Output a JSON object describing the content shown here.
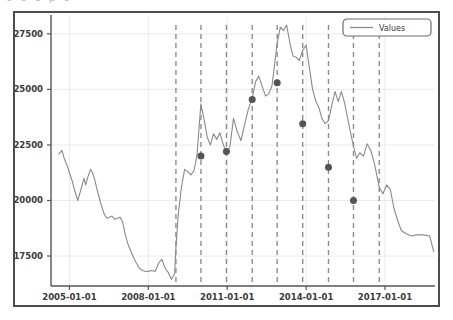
{
  "figure": {
    "background_color": "#ffffff",
    "frame_color": "#4d4d4d",
    "scan_artifact_text": "o    o  o  p  o"
  },
  "chart_data": {
    "type": "line",
    "title": "",
    "subtitle": "",
    "xlabel": "",
    "ylabel": "",
    "grid": true,
    "grid_color": "#e8e8ec",
    "legend": {
      "position": "upper right",
      "entries": [
        {
          "label": "Values",
          "color": "#8a8a8a",
          "marker": "line"
        }
      ]
    },
    "line_color": "#8a8a8a",
    "line_width": 1.1,
    "marker_color": "#545454",
    "marker_size": 7,
    "xaxis": {
      "type": "date",
      "tick_labels": [
        "2005-01-01",
        "2008-01-01",
        "2011-01-01",
        "2014-01-01",
        "2017-01-01"
      ],
      "tick_values": [
        2005.0,
        2008.0,
        2011.0,
        2014.0,
        2017.0
      ],
      "xlim": [
        2004.3,
        2018.9
      ]
    },
    "yaxis": {
      "tick_labels": [
        "17500",
        "20000",
        "22500",
        "25000",
        "27500"
      ],
      "tick_values": [
        17500,
        20000,
        22500,
        25000,
        27500
      ],
      "ylim": [
        16150,
        28350
      ]
    },
    "vlines": {
      "color": "#8a8a8a",
      "style": "dashed",
      "x_values": [
        2009.05,
        2010.0,
        2010.97,
        2011.95,
        2012.9,
        2013.87,
        2014.85,
        2015.8,
        2016.78
      ]
    },
    "markers": [
      {
        "x": 2010.0,
        "y": 22000
      },
      {
        "x": 2010.97,
        "y": 22200
      },
      {
        "x": 2011.95,
        "y": 24550
      },
      {
        "x": 2012.9,
        "y": 25300
      },
      {
        "x": 2013.87,
        "y": 23450
      },
      {
        "x": 2014.85,
        "y": 21500
      },
      {
        "x": 2015.8,
        "y": 20000
      }
    ],
    "series": [
      {
        "name": "Values",
        "x": [
          2004.6,
          2004.72,
          2004.8,
          2004.92,
          2005.0,
          2005.1,
          2005.2,
          2005.32,
          2005.44,
          2005.55,
          2005.62,
          2005.7,
          2005.8,
          2005.88,
          2005.96,
          2006.05,
          2006.14,
          2006.22,
          2006.32,
          2006.42,
          2006.52,
          2006.62,
          2006.72,
          2006.82,
          2006.92,
          2007.02,
          2007.12,
          2007.22,
          2007.34,
          2007.45,
          2007.56,
          2007.66,
          2007.78,
          2007.9,
          2008.02,
          2008.14,
          2008.26,
          2008.4,
          2008.52,
          2008.64,
          2008.76,
          2008.88,
          2009.0,
          2009.05,
          2009.14,
          2009.26,
          2009.38,
          2009.5,
          2009.62,
          2009.74,
          2009.85,
          2010.0,
          2010.12,
          2010.24,
          2010.36,
          2010.48,
          2010.6,
          2010.72,
          2010.84,
          2010.97,
          2011.1,
          2011.24,
          2011.38,
          2011.52,
          2011.66,
          2011.8,
          2011.95,
          2012.08,
          2012.2,
          2012.34,
          2012.46,
          2012.58,
          2012.7,
          2012.8,
          2012.9,
          2013.02,
          2013.14,
          2013.26,
          2013.38,
          2013.5,
          2013.62,
          2013.74,
          2013.87,
          2014.0,
          2014.12,
          2014.24,
          2014.36,
          2014.48,
          2014.6,
          2014.72,
          2014.85,
          2014.98,
          2015.1,
          2015.22,
          2015.34,
          2015.46,
          2015.58,
          2015.7,
          2015.8,
          2015.92,
          2016.04,
          2016.18,
          2016.32,
          2016.46,
          2016.6,
          2016.78,
          2016.92,
          2017.06,
          2017.2,
          2017.34,
          2017.48,
          2017.62,
          2017.8,
          2018.0,
          2018.2,
          2018.45,
          2018.7,
          2018.85
        ],
        "y": [
          22100,
          22250,
          21900,
          21550,
          21250,
          20900,
          20450,
          20000,
          20500,
          21000,
          20700,
          21050,
          21400,
          21250,
          20950,
          20500,
          20100,
          19750,
          19400,
          19200,
          19250,
          19300,
          19150,
          19200,
          19250,
          19050,
          18500,
          18050,
          17700,
          17400,
          17150,
          16950,
          16850,
          16800,
          16820,
          16850,
          16800,
          17200,
          17350,
          16950,
          16750,
          16450,
          16700,
          17900,
          19400,
          20600,
          21400,
          21300,
          21150,
          21350,
          22050,
          24350,
          23650,
          22850,
          22500,
          23000,
          22750,
          23050,
          22550,
          22150,
          22400,
          23700,
          23100,
          22700,
          23400,
          24100,
          24600,
          25350,
          25600,
          25100,
          24700,
          24800,
          25150,
          26100,
          27100,
          27800,
          27650,
          27900,
          27100,
          26500,
          26450,
          26300,
          26750,
          27000,
          26000,
          25050,
          24500,
          24200,
          23700,
          23450,
          23600,
          24300,
          24900,
          24450,
          24900,
          24400,
          23700,
          23000,
          22450,
          21900,
          22150,
          22000,
          22550,
          22250,
          21650,
          20600,
          20300,
          20700,
          20500,
          19650,
          19100,
          18650,
          18500,
          18400,
          18450,
          18450,
          18400,
          17700
        ]
      }
    ]
  }
}
